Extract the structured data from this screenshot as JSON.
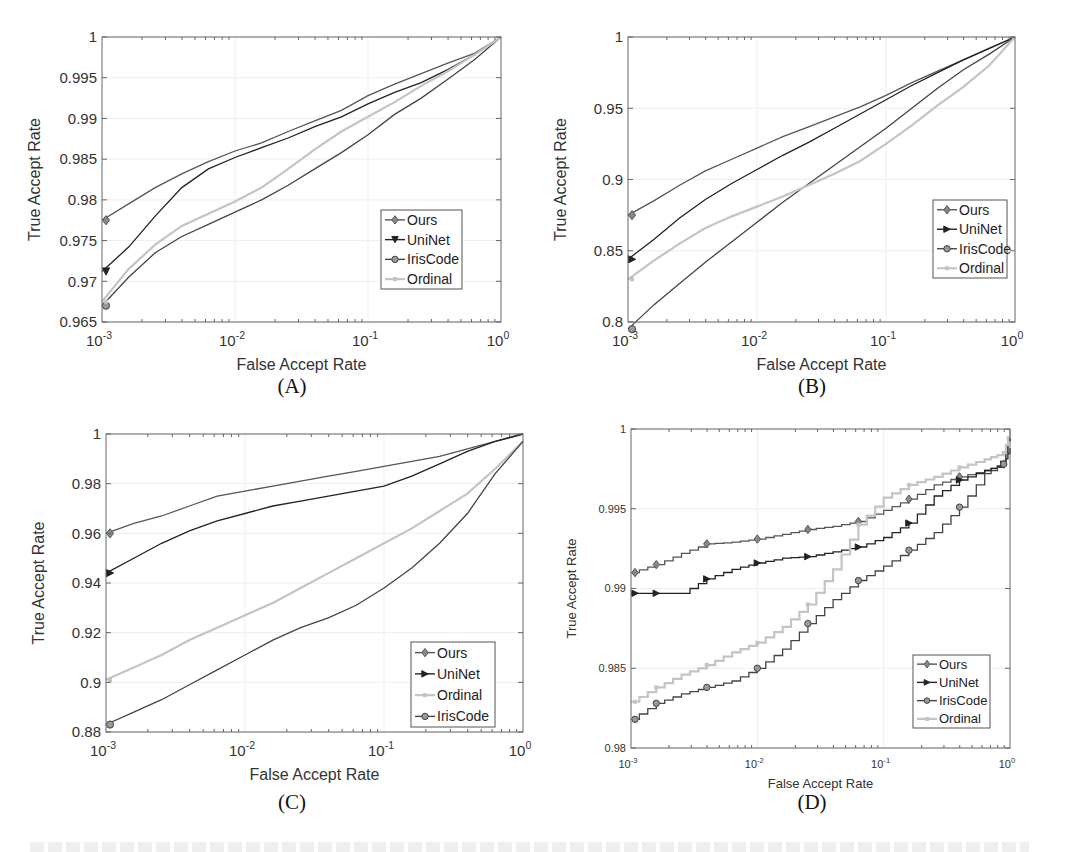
{
  "figure": {
    "panels": [
      "(A)",
      "(B)",
      "(C)",
      "(D)"
    ]
  },
  "colors": {
    "Ours": "#555555",
    "UniNet": "#222222",
    "IrisCode": "#444444",
    "Ordinal": "#c4c4c4",
    "axis": "#666666",
    "grid": "#eeeeee",
    "text": "#333333"
  },
  "chart_data": [
    {
      "id": "A",
      "type": "line",
      "title": "",
      "panel_label": "(A)",
      "xlabel": "False Accept Rate",
      "ylabel": "True Accept Rate",
      "xscale": "log",
      "xlim": [
        0.001,
        1
      ],
      "ylim": [
        0.965,
        1
      ],
      "xticks": [
        "10^-3",
        "10^-2",
        "10^-1",
        "10^0"
      ],
      "yticks": [
        "0.965",
        "0.97",
        "0.975",
        "0.98",
        "0.985",
        "0.99",
        "0.995",
        "1"
      ],
      "ytick_values": [
        0.965,
        0.97,
        0.975,
        0.98,
        0.985,
        0.99,
        0.995,
        1
      ],
      "grid": true,
      "legend": [
        "Ours",
        "UniNet",
        "IrisCode",
        "Ordinal"
      ],
      "legend_position": "lower right",
      "plot_box": {
        "x0": 102,
        "y0": 37,
        "x1": 501,
        "y1": 322
      },
      "legend_box": {
        "x": 381,
        "y": 210,
        "w": 81,
        "h": 79
      },
      "x_log10": [
        -3,
        -2.8,
        -2.6,
        -2.4,
        -2.2,
        -2.0,
        -1.8,
        -1.6,
        -1.4,
        -1.2,
        -1.0,
        -0.8,
        -0.6,
        -0.4,
        -0.2,
        0
      ],
      "series": [
        {
          "name": "Ours",
          "marker": "diamond",
          "values": [
            0.9775,
            0.9795,
            0.9815,
            0.9832,
            0.9847,
            0.986,
            0.987,
            0.9884,
            0.9897,
            0.991,
            0.9928,
            0.9942,
            0.9955,
            0.9968,
            0.998,
            1.0
          ]
        },
        {
          "name": "UniNet",
          "marker": "triangle-down",
          "values": [
            0.9712,
            0.9742,
            0.978,
            0.9815,
            0.9838,
            0.9852,
            0.9864,
            0.9876,
            0.989,
            0.9902,
            0.9918,
            0.9932,
            0.9944,
            0.996,
            0.9978,
            1.0
          ]
        },
        {
          "name": "IrisCode",
          "marker": "circle",
          "values": [
            0.967,
            0.9705,
            0.9735,
            0.9755,
            0.977,
            0.9785,
            0.98,
            0.9818,
            0.9838,
            0.9858,
            0.988,
            0.9905,
            0.9925,
            0.9948,
            0.9972,
            1.0
          ]
        },
        {
          "name": "Ordinal",
          "marker": "square",
          "values": [
            0.9675,
            0.9715,
            0.9745,
            0.9768,
            0.9783,
            0.9798,
            0.9815,
            0.9838,
            0.9862,
            0.9884,
            0.9902,
            0.992,
            0.994,
            0.9958,
            0.9978,
            1.0
          ]
        }
      ]
    },
    {
      "id": "B",
      "type": "line",
      "title": "",
      "panel_label": "(B)",
      "xlabel": "False Accept Rate",
      "ylabel": "True Accept Rate",
      "xscale": "log",
      "xlim": [
        0.001,
        1
      ],
      "ylim": [
        0.8,
        1
      ],
      "xticks": [
        "10^-3",
        "10^-2",
        "10^-1",
        "10^0"
      ],
      "yticks": [
        "0.8",
        "0.85",
        "0.9",
        "0.95",
        "1"
      ],
      "ytick_values": [
        0.8,
        0.85,
        0.9,
        0.95,
        1
      ],
      "grid": true,
      "legend": [
        "Ours",
        "UniNet",
        "IrisCode",
        "Ordinal"
      ],
      "legend_position": "lower right",
      "plot_box": {
        "x0": 628,
        "y0": 37,
        "x1": 1015,
        "y1": 322
      },
      "legend_box": {
        "x": 933,
        "y": 200,
        "w": 74,
        "h": 78
      },
      "x_log10": [
        -3,
        -2.8,
        -2.6,
        -2.4,
        -2.2,
        -2.0,
        -1.8,
        -1.6,
        -1.4,
        -1.2,
        -1.0,
        -0.8,
        -0.6,
        -0.4,
        -0.2,
        0
      ],
      "series": [
        {
          "name": "Ours",
          "marker": "diamond",
          "values": [
            0.875,
            0.885,
            0.896,
            0.906,
            0.914,
            0.922,
            0.93,
            0.937,
            0.944,
            0.951,
            0.959,
            0.968,
            0.976,
            0.984,
            0.992,
            1.0
          ]
        },
        {
          "name": "UniNet",
          "marker": "triangle-right",
          "values": [
            0.844,
            0.858,
            0.873,
            0.886,
            0.897,
            0.907,
            0.917,
            0.926,
            0.936,
            0.946,
            0.956,
            0.966,
            0.975,
            0.984,
            0.992,
            1.0
          ]
        },
        {
          "name": "IrisCode",
          "marker": "circle",
          "values": [
            0.795,
            0.812,
            0.827,
            0.842,
            0.856,
            0.87,
            0.884,
            0.897,
            0.91,
            0.923,
            0.936,
            0.95,
            0.964,
            0.977,
            0.988,
            1.0
          ]
        },
        {
          "name": "Ordinal",
          "marker": "square",
          "values": [
            0.83,
            0.843,
            0.855,
            0.866,
            0.874,
            0.881,
            0.888,
            0.896,
            0.904,
            0.913,
            0.925,
            0.938,
            0.952,
            0.965,
            0.98,
            1.0
          ]
        }
      ]
    },
    {
      "id": "C",
      "type": "line",
      "title": "",
      "panel_label": "(C)",
      "xlabel": "False Accept Rate",
      "ylabel": "True Accept Rate",
      "xscale": "log",
      "xlim": [
        0.001,
        1
      ],
      "ylim": [
        0.88,
        1
      ],
      "xticks": [
        "10^-3",
        "10^-2",
        "10^-1",
        "10^0"
      ],
      "yticks": [
        "0.88",
        "0.9",
        "0.92",
        "0.94",
        "0.96",
        "0.98",
        "1"
      ],
      "ytick_values": [
        0.88,
        0.9,
        0.92,
        0.94,
        0.96,
        0.98,
        1
      ],
      "grid": true,
      "legend": [
        "Ours",
        "UniNet",
        "Ordinal",
        "IrisCode"
      ],
      "legend_position": "lower right",
      "plot_box": {
        "x0": 106,
        "y0": 434,
        "x1": 523,
        "y1": 732
      },
      "legend_box": {
        "x": 411,
        "y": 642,
        "w": 84,
        "h": 85
      },
      "x_log10": [
        -3,
        -2.8,
        -2.6,
        -2.4,
        -2.2,
        -2.0,
        -1.8,
        -1.6,
        -1.4,
        -1.2,
        -1.0,
        -0.8,
        -0.6,
        -0.4,
        -0.2,
        0
      ],
      "series": [
        {
          "name": "Ours",
          "marker": "diamond",
          "values": [
            0.96,
            0.964,
            0.967,
            0.971,
            0.975,
            0.977,
            0.979,
            0.981,
            0.983,
            0.985,
            0.987,
            0.989,
            0.991,
            0.994,
            0.997,
            1.0
          ]
        },
        {
          "name": "UniNet",
          "marker": "triangle-right",
          "values": [
            0.944,
            0.95,
            0.956,
            0.961,
            0.965,
            0.968,
            0.971,
            0.973,
            0.975,
            0.977,
            0.979,
            0.983,
            0.988,
            0.993,
            0.997,
            1.0
          ]
        },
        {
          "name": "Ordinal",
          "marker": "square",
          "values": [
            0.901,
            0.906,
            0.911,
            0.917,
            0.922,
            0.927,
            0.932,
            0.938,
            0.944,
            0.95,
            0.956,
            0.962,
            0.969,
            0.976,
            0.986,
            0.997
          ]
        },
        {
          "name": "IrisCode",
          "marker": "circle",
          "values": [
            0.883,
            0.888,
            0.893,
            0.899,
            0.905,
            0.911,
            0.917,
            0.922,
            0.926,
            0.931,
            0.938,
            0.946,
            0.956,
            0.968,
            0.984,
            0.997
          ]
        }
      ]
    },
    {
      "id": "D",
      "type": "line",
      "title": "",
      "panel_label": "(D)",
      "xlabel": "False Accept Rate",
      "ylabel": "True Accept Rate",
      "xscale": "log",
      "xlim": [
        0.001,
        1
      ],
      "ylim": [
        0.98,
        1
      ],
      "xticks": [
        "10^-3",
        "10^-2",
        "10^-1",
        "10^0"
      ],
      "yticks": [
        "0.98",
        "0.985",
        "0.99",
        "0.995",
        "1"
      ],
      "ytick_values": [
        0.98,
        0.985,
        0.99,
        0.995,
        1
      ],
      "grid": true,
      "step": true,
      "legend": [
        "Ours",
        "UniNet",
        "IrisCode",
        "Ordinal"
      ],
      "legend_position": "lower right",
      "plot_box": {
        "x0": 631,
        "y0": 429,
        "x1": 1010,
        "y1": 748
      },
      "legend_box": {
        "x": 913,
        "y": 655,
        "w": 77,
        "h": 73
      },
      "x_log10": [
        -3,
        -2.8,
        -2.6,
        -2.4,
        -2.2,
        -2.0,
        -1.8,
        -1.6,
        -1.4,
        -1.2,
        -1.0,
        -0.8,
        -0.6,
        -0.4,
        -0.2,
        -0.05,
        0
      ],
      "series": [
        {
          "name": "Ours",
          "marker": "diamond",
          "values": [
            0.991,
            0.9915,
            0.9922,
            0.9928,
            0.9929,
            0.9931,
            0.9934,
            0.9937,
            0.9939,
            0.9942,
            0.9949,
            0.9956,
            0.9965,
            0.997,
            0.9974,
            0.9978,
            1.0
          ]
        },
        {
          "name": "UniNet",
          "marker": "triangle-right",
          "values": [
            0.9897,
            0.9897,
            0.9897,
            0.9906,
            0.9912,
            0.9916,
            0.9919,
            0.992,
            0.9923,
            0.9926,
            0.9932,
            0.9941,
            0.9958,
            0.9968,
            0.9974,
            0.9978,
            0.9988
          ]
        },
        {
          "name": "IrisCode",
          "marker": "circle",
          "values": [
            0.9818,
            0.9828,
            0.9834,
            0.9838,
            0.9842,
            0.985,
            0.9862,
            0.9878,
            0.9893,
            0.9905,
            0.9914,
            0.9924,
            0.9935,
            0.9951,
            0.9972,
            0.9978,
            1.0
          ]
        },
        {
          "name": "Ordinal",
          "marker": "square",
          "values": [
            0.9829,
            0.9838,
            0.9846,
            0.9852,
            0.986,
            0.9866,
            0.9876,
            0.989,
            0.9912,
            0.994,
            0.9957,
            0.9965,
            0.997,
            0.9976,
            0.9981,
            0.9985,
            1.0
          ]
        }
      ]
    }
  ]
}
